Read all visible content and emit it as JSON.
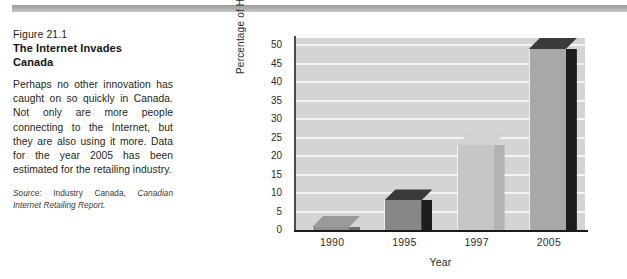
{
  "figure": {
    "number": "Figure 21.1",
    "title_line1": "The Internet Invades",
    "title_line2": "Canada",
    "body": "Perhaps no other innovation has caught on so quickly in Canada. Not only are more people connecting to the Internet, but they are also using it more. Data for the year 2005 has been estimated for the retailing industry.",
    "source_prefix": "Source:",
    "source_plain": "Industry Canada,",
    "source_italic": "Canadian Internet Retailing Report."
  },
  "chart_data": {
    "type": "bar",
    "title": "",
    "categories": [
      "1990",
      "1995",
      "1997",
      "2005"
    ],
    "values": [
      0.4,
      8,
      23,
      49
    ],
    "xlabel": "Year",
    "ylabel": "Percentage of Households",
    "ylim": [
      0,
      52
    ],
    "yticks": [
      0,
      5,
      10,
      15,
      20,
      25,
      30,
      35,
      40,
      45,
      50
    ],
    "ytick_labels": [
      "0",
      "5",
      "10",
      "15",
      "20",
      "25",
      "30",
      "35",
      "40",
      "45",
      "50"
    ],
    "grid": true,
    "grid_color": "#f4f4f4",
    "plot_bg": "#d4d4d4",
    "legend": null,
    "bar_colors": [
      "#8f8f8f",
      "#878787",
      "#c6c6c6",
      "#a8a8a8"
    ],
    "bar_side_colors": [
      "#6e6e6e",
      "#1d1d1d",
      "#b3b3b3",
      "#1d1d1d"
    ],
    "bar_top_colors": [
      "#9a9a9a",
      "#3a3a3a",
      "#d2d2d2",
      "#3a3a3a"
    ]
  }
}
